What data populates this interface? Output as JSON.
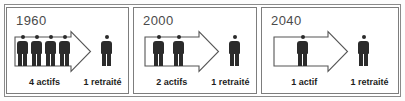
{
  "figure": {
    "colors": {
      "figure_fill": "#2b2b2b",
      "frame_border": "#7d7d7d",
      "outer_border": "#8a8a8a",
      "year_text": "#4a4a4a",
      "caption_text": "#1d1d1d",
      "background": "#ffffff"
    }
  },
  "panels": [
    {
      "year": "1960",
      "workers_count": 4,
      "retirees_count": 1,
      "caption_left": "4 actifs",
      "caption_right": "1 retraité"
    },
    {
      "year": "2000",
      "workers_count": 2,
      "retirees_count": 1,
      "caption_left": "2 actifs",
      "caption_right": "1 retraité"
    },
    {
      "year": "2040",
      "workers_count": 1,
      "retirees_count": 1,
      "caption_left": "1 actif",
      "caption_right": "1 retraité"
    }
  ]
}
